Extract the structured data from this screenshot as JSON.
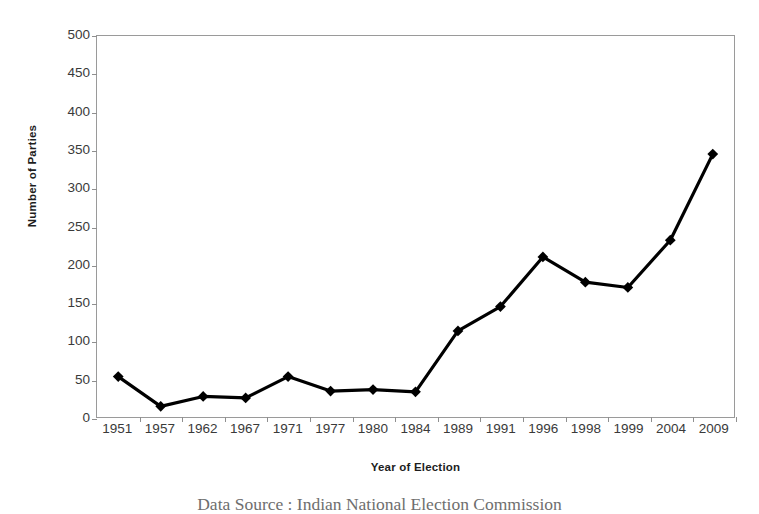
{
  "chart_data": {
    "type": "line",
    "title": "",
    "xlabel": "Year of Election",
    "ylabel": "Number of Parties",
    "categories": [
      "1951",
      "1957",
      "1962",
      "1967",
      "1971",
      "1977",
      "1980",
      "1984",
      "1989",
      "1991",
      "1996",
      "1998",
      "1999",
      "2004",
      "2009"
    ],
    "values": [
      53,
      14,
      27,
      25,
      53,
      34,
      36,
      33,
      113,
      145,
      210,
      177,
      170,
      232,
      345
    ],
    "series": [
      {
        "name": "Number of Parties",
        "values": [
          53,
          14,
          27,
          25,
          53,
          34,
          36,
          33,
          113,
          145,
          210,
          177,
          170,
          232,
          345
        ]
      }
    ],
    "ylim": [
      0,
      500
    ],
    "yticks": [
      0,
      50,
      100,
      150,
      200,
      250,
      300,
      350,
      400,
      450,
      500
    ],
    "ytick_labels": [
      "0",
      "50",
      "100",
      "150",
      "200",
      "250",
      "300",
      "350",
      "400",
      "450",
      "500"
    ],
    "grid": false,
    "legend": false,
    "legend_position": "none",
    "marker": "diamond",
    "line_color": "#000000",
    "marker_color": "#000000",
    "frame_color": "#9a9a9a",
    "background_color": "#ffffff"
  },
  "caption": {
    "text": "Data Source : Indian National Election Commission"
  }
}
